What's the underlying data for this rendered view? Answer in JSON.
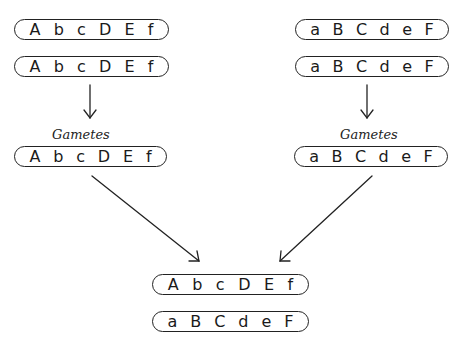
{
  "diagram": {
    "parents": {
      "left": {
        "chromosomes": [
          {
            "alleles": [
              "A",
              "b",
              "c",
              "D",
              "E",
              "f"
            ]
          },
          {
            "alleles": [
              "A",
              "b",
              "c",
              "D",
              "E",
              "f"
            ]
          }
        ]
      },
      "right": {
        "chromosomes": [
          {
            "alleles": [
              "a",
              "B",
              "C",
              "d",
              "e",
              "F"
            ]
          },
          {
            "alleles": [
              "a",
              "B",
              "C",
              "d",
              "e",
              "F"
            ]
          }
        ]
      }
    },
    "gametes": {
      "left": {
        "label": "Gametes",
        "alleles": [
          "A",
          "b",
          "c",
          "D",
          "E",
          "f"
        ]
      },
      "right": {
        "label": "Gametes",
        "alleles": [
          "a",
          "B",
          "C",
          "d",
          "e",
          "F"
        ]
      }
    },
    "offspring": {
      "chromosomes": [
        {
          "alleles": [
            "A",
            "b",
            "c",
            "D",
            "E",
            "f"
          ]
        },
        {
          "alleles": [
            "a",
            "B",
            "C",
            "d",
            "e",
            "F"
          ]
        }
      ]
    },
    "colors": {
      "line": "#222222",
      "background": "#ffffff"
    }
  }
}
